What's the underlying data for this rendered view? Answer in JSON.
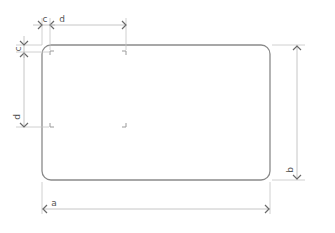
{
  "diagram": {
    "labels": {
      "width": "a",
      "height": "b",
      "margin": "c",
      "inner_size": "d"
    },
    "colors": {
      "card_stroke": "#8a8a8a",
      "dimension_line": "#b8b8b8",
      "arrow": "#6a6a6a",
      "label": "#555555"
    }
  }
}
